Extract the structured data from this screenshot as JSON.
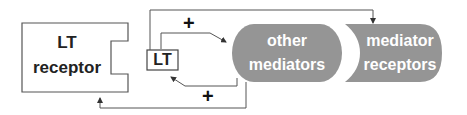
{
  "diagram": {
    "nodes": {
      "lt_receptor": {
        "line1": "LT",
        "line2": "receptor"
      },
      "lt": {
        "label": "LT"
      },
      "other_mediators": {
        "line1": "other",
        "line2": "mediators"
      },
      "mediator_receptors": {
        "line1": "mediator",
        "line2": "receptors"
      }
    },
    "edges": {
      "lt_to_other_sign": "+",
      "other_to_lt_sign": "+"
    },
    "colors": {
      "pill_fill": "#959595",
      "stroke": "#444444",
      "pill_text": "#ffffff"
    }
  }
}
